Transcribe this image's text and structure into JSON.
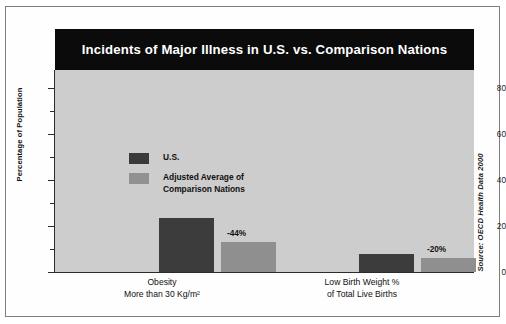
{
  "figure": {
    "title": "Incidents of Major Illness in U.S. vs. Comparison Nations",
    "source_note": "Source: OECD Health Data 2000",
    "title_bg": "#0b0b0b",
    "plot_bg": "#cdcdcd",
    "us_color": "#3c3c3c",
    "adjusted_color": "#8f8f8f"
  },
  "legend": {
    "items": [
      {
        "label": "U.S.",
        "color": "#3c3c3c",
        "swatch": "us-legend-swatch"
      },
      {
        "label": "Adjusted Average of\nComparison Nations",
        "color": "#8f8f8f",
        "swatch": "adjusted-legend-swatch"
      }
    ]
  },
  "axes": {
    "y_title": "Percentage of Population",
    "y_ticks": [
      "0",
      "20",
      "40",
      "60",
      "80"
    ],
    "y_minor_ticks": [
      "10",
      "30",
      "50",
      "70"
    ],
    "x_categories": [
      "Obesity\nMore than 30 Kg/m²",
      "Low Birth Weight %\nof Total Live Births"
    ]
  },
  "chart_data": {
    "type": "bar",
    "title": "Incidents of Major Illness in U.S. vs. Comparison Nations",
    "xlabel": "",
    "ylabel": "Percentage of Population",
    "ylim": [
      0,
      88
    ],
    "yticks": [
      0,
      20,
      40,
      60,
      80
    ],
    "yminorticks": [
      10,
      30,
      50,
      70
    ],
    "grid": false,
    "legend_position": "upper-left-inside",
    "categories": [
      "Obesity More than 30 Kg/m²",
      "Low Birth Weight % of Total Live Births"
    ],
    "series": [
      {
        "name": "U.S.",
        "color": "#3c3c3c",
        "values": [
          23.5,
          7.7
        ]
      },
      {
        "name": "Adjusted Average of Comparison Nations",
        "color": "#8f8f8f",
        "values": [
          13.2,
          6.1
        ]
      }
    ],
    "annotations": [
      {
        "text": "-44%",
        "category": "Obesity More than 30 Kg/m²",
        "series": "Adjusted Average of Comparison Nations"
      },
      {
        "text": "-20%",
        "category": "Low Birth Weight % of Total Live Births",
        "series": "Adjusted Average of Comparison Nations"
      }
    ],
    "source": "Source: OECD Health Data 2000"
  },
  "bars": [
    {
      "name": "obesity-us-bar",
      "value": 23.5,
      "left": 104,
      "width": 55,
      "label": ""
    },
    {
      "name": "obesity-adj-bar",
      "value": 13.2,
      "left": 166,
      "width": 55,
      "label": "-44%"
    },
    {
      "name": "lbw-us-bar",
      "value": 7.7,
      "left": 304,
      "width": 55,
      "label": ""
    },
    {
      "name": "lbw-adj-bar",
      "value": 6.1,
      "left": 366,
      "width": 55,
      "label": "-20%"
    }
  ]
}
